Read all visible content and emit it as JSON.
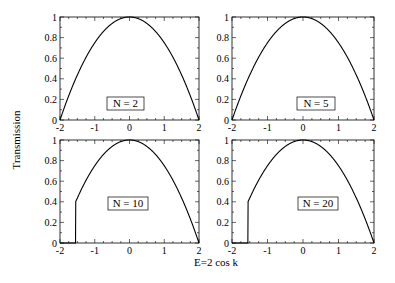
{
  "figure": {
    "ylabel": "Transmission",
    "xlabel": "E=2 cos k",
    "line_color": "#000000",
    "background": "#ffffff"
  },
  "chart_data": [
    {
      "type": "line",
      "panel": "top-left",
      "label": "N = 2",
      "N": 2,
      "xlabel": "E=2 cos k",
      "ylabel": "Transmission",
      "xlim": [
        -2,
        2
      ],
      "ylim": [
        0,
        1
      ],
      "xticks": [
        "-2",
        "-1",
        "0",
        "1",
        "2"
      ],
      "yticks": [
        "0",
        "0.2",
        "0.4",
        "0.6",
        "0.8",
        "1"
      ],
      "x": [
        -2,
        -1.9,
        -1.5,
        -1,
        -0.5,
        0,
        0.5,
        1,
        1.5,
        1.9,
        2
      ],
      "values": [
        0,
        0.3,
        0.7,
        0.85,
        0.94,
        0.99,
        1.0,
        0.97,
        0.85,
        0.5,
        0
      ]
    },
    {
      "type": "line",
      "panel": "top-right",
      "label": "N = 5",
      "N": 5,
      "xlim": [
        -2,
        2
      ],
      "ylim": [
        0,
        1
      ],
      "xticks": [
        "-2",
        "-1",
        "0",
        "1",
        "2"
      ],
      "yticks": [
        "0",
        "0.2",
        "0.4",
        "0.6",
        "0.8",
        "1"
      ],
      "x": [
        -2,
        -1.8,
        -1.5,
        -1.3,
        -1.15,
        -0.8,
        -0.1,
        0.5,
        1.15,
        1.5,
        1.8,
        2
      ],
      "values": [
        0,
        0.03,
        0.35,
        0.85,
        1.0,
        0.9,
        1.0,
        0.94,
        1.0,
        0.85,
        0.65,
        0
      ]
    },
    {
      "type": "line",
      "panel": "bottom-left",
      "label": "N = 10",
      "N": 10,
      "xlim": [
        -2,
        2
      ],
      "ylim": [
        0,
        1
      ],
      "xticks": [
        "-2",
        "-1",
        "0",
        "1",
        "2"
      ],
      "yticks": [
        "0",
        "0.2",
        "0.4",
        "0.6",
        "0.8",
        "1"
      ],
      "x": [
        -2,
        -1.6,
        -1.5,
        -1.45,
        -1.35,
        -1.2,
        -1.0,
        -0.7,
        -0.45,
        -0.15,
        0.15,
        0.5,
        0.8,
        1.1,
        1.35,
        1.6,
        1.8,
        1.9,
        2
      ],
      "values": [
        0,
        0,
        0.1,
        1.0,
        0.65,
        1.0,
        0.87,
        1.0,
        0.93,
        1.0,
        0.94,
        1.0,
        0.93,
        1.0,
        0.88,
        1.0,
        0.9,
        0.4,
        0
      ]
    },
    {
      "type": "line",
      "panel": "bottom-right",
      "label": "N = 20",
      "N": 20,
      "xlim": [
        -2,
        2
      ],
      "ylim": [
        0,
        1
      ],
      "xticks": [
        "-2",
        "-1",
        "0",
        "1",
        "2"
      ],
      "yticks": [
        "0",
        "0.2",
        "0.4",
        "0.6",
        "0.8",
        "1"
      ],
      "x": [
        -2,
        -1.55,
        -1.5,
        -1.45,
        -1.4,
        -1.3,
        -1.2,
        0,
        1.6,
        1.85,
        1.95,
        2
      ],
      "values": [
        0,
        0,
        1.0,
        0.3,
        1.0,
        0.55,
        0.75,
        0.95,
        0.82,
        0.65,
        1.0,
        0
      ]
    }
  ]
}
